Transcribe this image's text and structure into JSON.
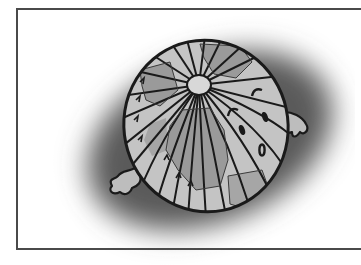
{
  "figure": {
    "colors": {
      "frame_border": "#4a4a4a",
      "background": "#ffffff",
      "shadow": "#5a5a5a",
      "globe_light": "#c4c4c4",
      "globe_dark": "#9a9a9a",
      "outline": "#1a1a1a",
      "pole": "#d8d8d8"
    },
    "elements": [
      "frame",
      "shadow",
      "globe",
      "north-pole",
      "meridians",
      "landmasses",
      "arrows",
      "raindrops",
      "left-hand",
      "right-hand"
    ]
  }
}
